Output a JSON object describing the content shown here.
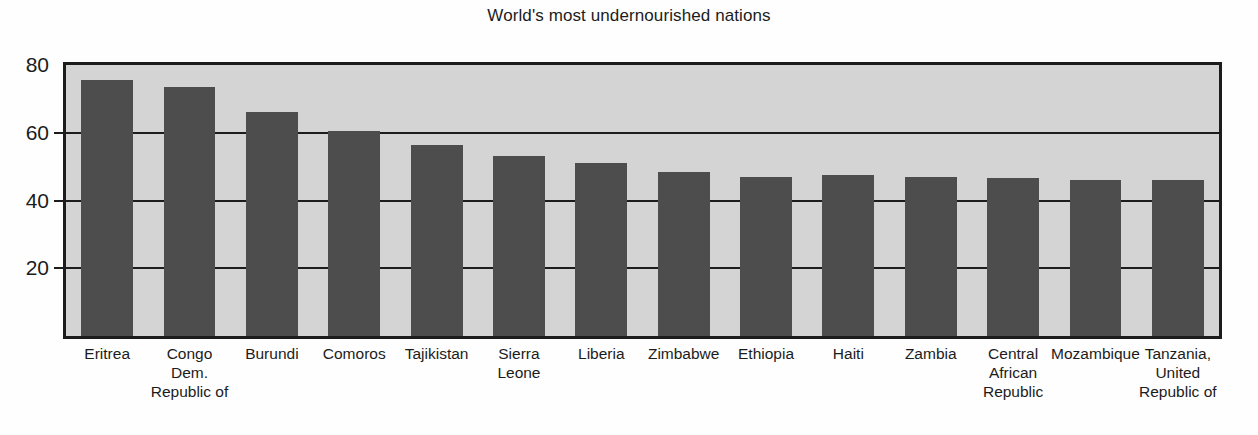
{
  "chart_data": {
    "type": "bar",
    "title": "World's most undernourished nations",
    "xlabel": "",
    "ylabel": "",
    "ylim": [
      0,
      80
    ],
    "yticks": [
      20,
      40,
      60,
      80
    ],
    "grid": true,
    "legend": "none",
    "categories": [
      "Eritrea",
      "Congo Dem. Republic of",
      "Burundi",
      "Comoros",
      "Tajikistan",
      "Sierra Leone",
      "Liberia",
      "Zimbabwe",
      "Ethiopia",
      "Haiti",
      "Zambia",
      "Central African Republic",
      "Mozambique",
      "Tanzania, United Republic of"
    ],
    "category_lines": [
      [
        "Eritrea"
      ],
      [
        "Congo",
        "Dem.",
        "Republic of"
      ],
      [
        "Burundi"
      ],
      [
        "Comoros"
      ],
      [
        "Tajikistan"
      ],
      [
        "Sierra",
        "Leone"
      ],
      [
        "Liberia"
      ],
      [
        "Zimbabwe"
      ],
      [
        "Ethiopia"
      ],
      [
        "Haiti"
      ],
      [
        "Zambia"
      ],
      [
        "Central",
        "African",
        "Republic"
      ],
      [
        "Mozambique"
      ],
      [
        "Tanzania,",
        "United",
        "Republic of"
      ]
    ],
    "values": [
      75.5,
      73.5,
      66,
      60.5,
      56.5,
      53,
      51,
      48.5,
      47,
      47.5,
      47,
      46.5,
      46,
      46
    ],
    "colors": {
      "bar_fill": "#4d4d4d",
      "plot_background": "#d4d4d4",
      "axis": "#1c1c1c",
      "page_background": "#fefefe"
    }
  }
}
